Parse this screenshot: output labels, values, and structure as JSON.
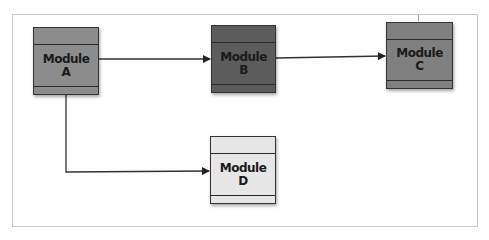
{
  "diagram": {
    "modules": [
      {
        "id": "A",
        "line1": "Module",
        "line2": "A",
        "fill": "#8c8c8c"
      },
      {
        "id": "B",
        "line1": "Module",
        "line2": "B",
        "fill": "#5c5c5c"
      },
      {
        "id": "C",
        "line1": "Module",
        "line2": "C",
        "fill": "#808080"
      },
      {
        "id": "D",
        "line1": "Module",
        "line2": "D",
        "fill": "#e6e6e6"
      }
    ],
    "edges": [
      {
        "from": "A",
        "to": "B"
      },
      {
        "from": "B",
        "to": "C"
      },
      {
        "from": "A",
        "to": "D"
      }
    ]
  }
}
